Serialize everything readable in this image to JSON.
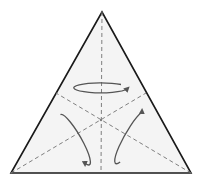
{
  "diagram": {
    "type": "equilateral-triangle-symmetry",
    "colors": {
      "background": "#ffffff",
      "fill": "#f4f4f4",
      "outline": "#1a1a1a",
      "dashed_lines": "#7f7f7f",
      "arrows": "#555555"
    },
    "vertices": {
      "apex": [
        102,
        12
      ],
      "bottom_left": [
        11,
        173
      ],
      "bottom_right": [
        191,
        173
      ]
    },
    "centroid": [
      101,
      120
    ],
    "medians": [
      {
        "name": "vertical",
        "from": [
          102,
          12
        ],
        "to": [
          101,
          173
        ]
      },
      {
        "name": "left-to-right-mid",
        "from": [
          11,
          173
        ],
        "to": [
          146,
          93
        ]
      },
      {
        "name": "right-to-left-mid",
        "from": [
          191,
          173
        ],
        "to": [
          56,
          93
        ]
      }
    ],
    "rotation_arrows": [
      {
        "name": "top",
        "center": [
          101,
          87
        ],
        "rx": 27,
        "ry": 5,
        "angle": 0,
        "arrow_direction": "right"
      },
      {
        "name": "left",
        "center": [
          74,
          138
        ],
        "rx": 29,
        "ry": 6,
        "angle": 60,
        "arrow_direction": "down"
      },
      {
        "name": "right",
        "center": [
          131,
          137
        ],
        "rx": 29,
        "ry": 6,
        "angle": -60,
        "arrow_direction": "up-right"
      }
    ]
  }
}
